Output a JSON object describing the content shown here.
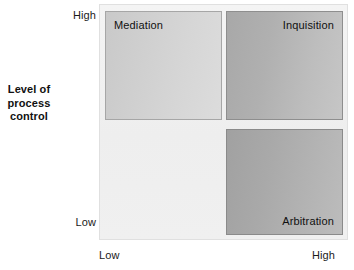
{
  "chart_data": {
    "type": "table",
    "title": "",
    "xlabel": "",
    "ylabel": "Level of process control",
    "x_ticks": [
      "Low",
      "High"
    ],
    "y_ticks": [
      "Low",
      "High"
    ],
    "grid": false,
    "legend": "none",
    "cells": [
      {
        "label": "Mediation",
        "x": "Low",
        "y": "High",
        "quadrant": "top-left",
        "label_align": "top-left",
        "fill": "#d2d2d2"
      },
      {
        "label": "Inquisition",
        "x": "High",
        "y": "High",
        "quadrant": "top-right",
        "label_align": "top-right",
        "fill": "#b5b5b5"
      },
      {
        "label": "Arbitration",
        "x": "High",
        "y": "Low",
        "quadrant": "bottom-right",
        "label_align": "bottom-right",
        "fill": "#adadad"
      }
    ]
  },
  "y_axis": {
    "title_lines": [
      "Level of",
      "process",
      "control"
    ],
    "tick_high": "High",
    "tick_low": "Low"
  },
  "x_axis": {
    "tick_low": "Low",
    "tick_high": "High"
  },
  "quadrants": {
    "mediation": "Mediation",
    "inquisition": "Inquisition",
    "arbitration": "Arbitration"
  },
  "colors": {
    "plot_background": "#f1f1f1",
    "box_light": "#d2d2d2",
    "box_medium": "#b5b5b5",
    "box_dark": "#adadad",
    "text": "#111111"
  }
}
